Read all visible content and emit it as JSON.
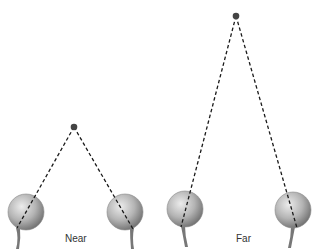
{
  "diagram": {
    "type": "convergence-of-eyes",
    "colors": {
      "dash_line": "#1a1a1a",
      "fixation_point": "#444444",
      "eyeball_light": "#e6e6e6",
      "eyeball_dark": "#7a7a7a",
      "optic_nerve": "#777777",
      "label_text": "#333333"
    },
    "panels": [
      {
        "label": "Near",
        "label_pos": [
          65,
          233
        ],
        "fixation_point": [
          74,
          127
        ],
        "eyes": [
          {
            "center": [
              26,
              212
            ],
            "radius": 18,
            "line_end": [
              17,
              228
            ],
            "nerve": [
              [
                18,
                228
              ],
              [
                20,
                238
              ],
              [
                18,
                249
              ]
            ]
          },
          {
            "center": [
              125,
              212
            ],
            "radius": 18,
            "line_end": [
              133,
              229
            ],
            "nerve": [
              [
                132,
                228
              ],
              [
                131,
                238
              ],
              [
                133,
                249
              ]
            ]
          }
        ]
      },
      {
        "label": "Far",
        "label_pos": [
          236,
          233
        ],
        "fixation_point": [
          236,
          16
        ],
        "eyes": [
          {
            "center": [
              185,
              209
            ],
            "radius": 18,
            "line_end": [
              181,
              227
            ],
            "nerve": [
              [
                183,
                226
              ],
              [
                184,
                236
              ],
              [
                187,
                247
              ]
            ]
          },
          {
            "center": [
              293,
              210
            ],
            "radius": 18,
            "line_end": [
              297,
              228
            ],
            "nerve": [
              [
                293,
                227
              ],
              [
                292,
                237
              ],
              [
                290,
                248
              ]
            ]
          }
        ]
      }
    ]
  }
}
